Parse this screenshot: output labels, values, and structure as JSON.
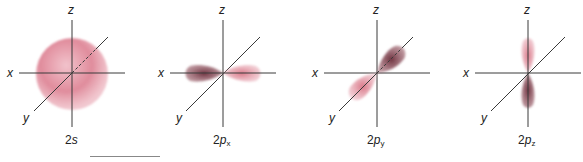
{
  "figure": {
    "colors": {
      "axis": "#3a3a3a",
      "lobe_positive": "#e08a9a",
      "lobe_negative": "#7a3a48",
      "sphere": "#e495a3"
    },
    "axis_labels": {
      "x": "x",
      "y": "y",
      "z": "z"
    },
    "panels": [
      {
        "name_main": "2",
        "name_orbital": "s",
        "name_sub": "",
        "shape": "sphere"
      },
      {
        "name_main": "2",
        "name_orbital": "p",
        "name_sub": "x",
        "shape": "p-lobes along x"
      },
      {
        "name_main": "2",
        "name_orbital": "p",
        "name_sub": "y",
        "shape": "p-lobes along y"
      },
      {
        "name_main": "2",
        "name_orbital": "p",
        "name_sub": "z",
        "shape": "p-lobes along z"
      }
    ]
  }
}
